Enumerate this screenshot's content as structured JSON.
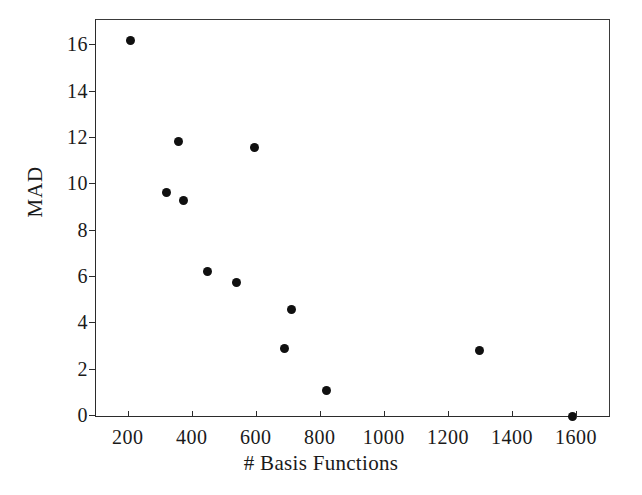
{
  "chart_data": {
    "type": "scatter",
    "title": "",
    "xlabel": "# Basis Functions",
    "ylabel": "MAD",
    "xlim": [
      98,
      1700
    ],
    "ylim": [
      0,
      17.1
    ],
    "grid": false,
    "legend": null,
    "xticks": [
      200,
      400,
      600,
      800,
      1000,
      1200,
      1400,
      1600
    ],
    "xtick_labels": [
      "200",
      "400",
      "600",
      "800",
      "1000",
      "1200",
      "1400",
      "1600"
    ],
    "yticks": [
      0,
      2,
      4,
      6,
      8,
      10,
      12,
      14,
      16
    ],
    "ytick_labels": [
      "0",
      "2",
      "4",
      "6",
      "8",
      "10",
      "12",
      "14",
      "16"
    ],
    "marker": "filled-circle",
    "marker_color": "#101010",
    "marker_size_px": 9,
    "points": [
      {
        "x": 206,
        "y": 16.2
      },
      {
        "x": 355,
        "y": 11.85
      },
      {
        "x": 594,
        "y": 11.6
      },
      {
        "x": 318,
        "y": 9.65
      },
      {
        "x": 371,
        "y": 9.3
      },
      {
        "x": 447,
        "y": 6.25
      },
      {
        "x": 538,
        "y": 5.75
      },
      {
        "x": 709,
        "y": 4.6
      },
      {
        "x": 688,
        "y": 2.9
      },
      {
        "x": 817,
        "y": 1.1
      },
      {
        "x": 1297,
        "y": 2.85
      },
      {
        "x": 1585,
        "y": 0.0
      }
    ],
    "x": [
      206,
      355,
      594,
      318,
      371,
      447,
      538,
      709,
      688,
      817,
      1297,
      1585
    ],
    "values": [
      16.2,
      11.85,
      11.6,
      9.65,
      9.3,
      6.25,
      5.75,
      4.6,
      2.9,
      1.1,
      2.85,
      0.0
    ]
  },
  "figure": {
    "background": "#ffffff",
    "axis_color": "#2b2b2b"
  }
}
